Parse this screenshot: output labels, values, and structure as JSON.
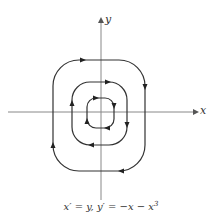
{
  "diagram": {
    "type": "phase-portrait",
    "axes": {
      "x_label": "x",
      "y_label": "y"
    },
    "caption": {
      "part1": "x′ = y, y′ = −x − x",
      "exponent": "3"
    },
    "orbits": [
      {
        "name": "outer",
        "direction": "clockwise"
      },
      {
        "name": "middle",
        "direction": "clockwise"
      },
      {
        "name": "inner",
        "direction": "clockwise"
      }
    ],
    "colors": {
      "line": "#333333",
      "axis": "#777777"
    }
  }
}
